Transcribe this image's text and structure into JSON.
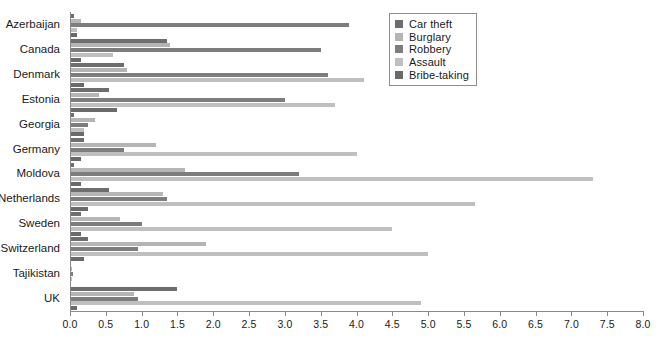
{
  "chart_data": {
    "type": "bar",
    "orientation": "horizontal",
    "title": "",
    "xlabel": "",
    "ylabel": "",
    "xlim": [
      0.0,
      8.0
    ],
    "grid": false,
    "legend_position": "top-right",
    "xticks": [
      "0.0",
      "0.5",
      "1.0",
      "1.5",
      "2.0",
      "2.5",
      "3.0",
      "3.5",
      "4.0",
      "4.5",
      "5.0",
      "5.5",
      "6.0",
      "6.5",
      "7.0",
      "7.5",
      "8.0"
    ],
    "xtick_values": [
      0.0,
      0.5,
      1.0,
      1.5,
      2.0,
      2.5,
      3.0,
      3.5,
      4.0,
      4.5,
      5.0,
      5.5,
      6.0,
      6.5,
      7.0,
      7.5,
      8.0
    ],
    "categories": [
      "Azerbaijan",
      "Canada",
      "Denmark",
      "Estonia",
      "Georgia",
      "Germany",
      "Moldova",
      "Netherlands",
      "Sweden",
      "Switzerland",
      "Tajikistan",
      "UK"
    ],
    "series": [
      {
        "name": "Car theft",
        "color": "#6e6e6e",
        "values": [
          0.05,
          1.35,
          0.75,
          0.55,
          0.05,
          0.2,
          0.05,
          0.55,
          0.15,
          0.25,
          0.02,
          1.5
        ]
      },
      {
        "name": "Burglary",
        "color": "#b5b5b5",
        "values": [
          0.15,
          1.4,
          0.8,
          0.4,
          0.35,
          1.2,
          1.6,
          1.3,
          0.7,
          1.9,
          0.03,
          0.9
        ]
      },
      {
        "name": "Robbery",
        "color": "#7d7d7d",
        "values": [
          3.9,
          3.5,
          3.6,
          3.0,
          0.25,
          0.75,
          3.2,
          1.35,
          1.0,
          0.95,
          0.04,
          0.95
        ]
      },
      {
        "name": "Assault",
        "color": "#bfbfbf",
        "values": [
          0.1,
          0.6,
          4.1,
          3.7,
          0.2,
          4.0,
          7.3,
          5.65,
          4.5,
          5.0,
          0.03,
          4.9
        ]
      },
      {
        "name": "Bribe-taking",
        "color": "#6a6a6a",
        "values": [
          0.1,
          0.15,
          0.2,
          0.65,
          0.2,
          0.15,
          0.15,
          0.25,
          0.15,
          0.2,
          0.02,
          0.1
        ]
      }
    ]
  },
  "legend": {
    "items": [
      {
        "label": "Car theft",
        "color": "#6e6e6e"
      },
      {
        "label": "Burglary",
        "color": "#b5b5b5"
      },
      {
        "label": "Robbery",
        "color": "#7d7d7d"
      },
      {
        "label": "Assault",
        "color": "#bfbfbf"
      },
      {
        "label": "Bribe-taking",
        "color": "#6a6a6a"
      }
    ]
  },
  "axis": {
    "line_color": "#8a8a8a",
    "text_color": "#1a1a1a"
  }
}
